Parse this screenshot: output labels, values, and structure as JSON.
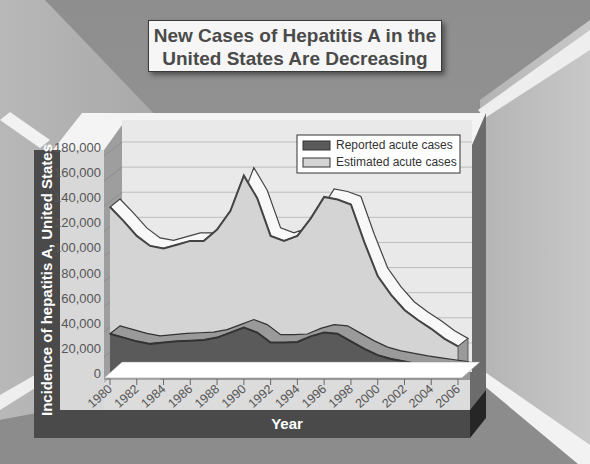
{
  "title_lines": [
    "New Cases of Hepatitis A in the",
    "United States Are Decreasing"
  ],
  "chart_data": {
    "type": "area",
    "title": "New Cases of Hepatitis A in the United States Are Decreasing",
    "xlabel": "Year",
    "ylabel": "Incidence of hepatitis A, United States",
    "x": [
      1980,
      1981,
      1982,
      1983,
      1984,
      1985,
      1986,
      1987,
      1988,
      1989,
      1990,
      1991,
      1992,
      1993,
      1994,
      1995,
      1996,
      1997,
      1998,
      1999,
      2000,
      2001,
      2002,
      2003,
      2004,
      2005,
      2006
    ],
    "xticks": [
      "1980",
      "1982",
      "1984",
      "1986",
      "1988",
      "1990",
      "1992",
      "1994",
      "1996",
      "1998",
      "2000",
      "2002",
      "2004",
      "2006"
    ],
    "yticks": [
      "0",
      "20,000",
      "40,000",
      "60,000",
      "80,000",
      "100,000",
      "120,000",
      "140,000",
      "160,000",
      "180,000"
    ],
    "ylim": [
      0,
      180000
    ],
    "grid": true,
    "legend_position": "top-right",
    "series": [
      {
        "name": "Estimated acute cases",
        "color": "#d4d4d4",
        "values": [
          133000,
          122000,
          110000,
          102000,
          100000,
          103000,
          106000,
          106000,
          115000,
          130000,
          158000,
          140000,
          110000,
          106000,
          110000,
          124000,
          141000,
          139000,
          135000,
          105000,
          78000,
          63000,
          51000,
          43000,
          36000,
          28000,
          22000
        ]
      },
      {
        "name": "Reported acute cases",
        "color": "#5a5a5a",
        "values": [
          32000,
          29000,
          26000,
          24000,
          25000,
          26000,
          26500,
          27000,
          29000,
          33000,
          37000,
          33000,
          25000,
          25000,
          25500,
          30000,
          33000,
          32000,
          26000,
          20000,
          15000,
          12000,
          10000,
          8000,
          6500,
          5000,
          3500
        ]
      }
    ],
    "legend": [
      "Reported acute cases",
      "Estimated acute cases"
    ]
  }
}
